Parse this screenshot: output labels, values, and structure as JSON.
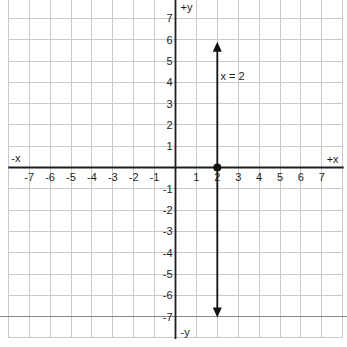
{
  "chart_data": {
    "type": "line",
    "title": "",
    "xlabel": "",
    "ylabel": "",
    "xlim": [
      -8,
      8
    ],
    "ylim": [
      -8,
      8
    ],
    "grid": true,
    "axis_labels": {
      "pos_x": "+x",
      "neg_x": "-x",
      "pos_y": "+y",
      "neg_y": "-y"
    },
    "x_ticks": [
      {
        "value": -7,
        "label": "-7"
      },
      {
        "value": -6,
        "label": "-6"
      },
      {
        "value": -5,
        "label": "-5"
      },
      {
        "value": -4,
        "label": "-4"
      },
      {
        "value": -3,
        "label": "-3"
      },
      {
        "value": -2,
        "label": "-2"
      },
      {
        "value": -1,
        "label": "-1"
      },
      {
        "value": 1,
        "label": "1"
      },
      {
        "value": 2,
        "label": "2"
      },
      {
        "value": 3,
        "label": "3"
      },
      {
        "value": 4,
        "label": "4"
      },
      {
        "value": 5,
        "label": "5"
      },
      {
        "value": 6,
        "label": "6"
      },
      {
        "value": 7,
        "label": "7"
      }
    ],
    "y_ticks": [
      {
        "value": 7,
        "label": "7"
      },
      {
        "value": 6,
        "label": "6"
      },
      {
        "value": 5,
        "label": "5"
      },
      {
        "value": 4,
        "label": "4"
      },
      {
        "value": 3,
        "label": "3"
      },
      {
        "value": 2,
        "label": "2"
      },
      {
        "value": 1,
        "label": "1"
      },
      {
        "value": -1,
        "label": "-1"
      },
      {
        "value": -2,
        "label": "-2"
      },
      {
        "value": -3,
        "label": "-3"
      },
      {
        "value": -4,
        "label": "-4"
      },
      {
        "value": -5,
        "label": "-5"
      },
      {
        "value": -6,
        "label": "-6"
      },
      {
        "value": -7,
        "label": "-7"
      }
    ],
    "series": [
      {
        "name": "x = 2",
        "kind": "vertical-line",
        "x": 2,
        "y_from": -7,
        "y_to": 6,
        "arrows": "both",
        "color": "#111111"
      }
    ],
    "points": [
      {
        "x": 2,
        "y": 0,
        "label": ""
      }
    ],
    "annotations": [
      {
        "text": "x = 2",
        "x": 2.15,
        "y": 4.1
      }
    ],
    "colors": {
      "grid": "#c9c9c9",
      "axes": "#1e1e1e",
      "background": "#ffffff"
    }
  }
}
